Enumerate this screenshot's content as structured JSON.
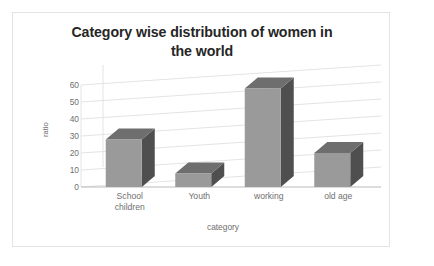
{
  "chart_data": {
    "type": "bar",
    "title": "Category wise distribution of women in the world",
    "title_line1": "Category wise distribution of women in",
    "title_line2": "the world",
    "xlabel": "category",
    "ylabel": "ratio",
    "categories": [
      "School children",
      "Youth",
      "working",
      "old age"
    ],
    "values": [
      28,
      8,
      58,
      20
    ],
    "ylim": [
      0,
      60
    ],
    "yticks": [
      60,
      50,
      40,
      30,
      20,
      10,
      0
    ],
    "ytick_labels": [
      "60",
      "50",
      "40",
      "30",
      "20",
      "10",
      "0"
    ],
    "grid": true,
    "legend": "none",
    "style": "3d-column",
    "colors": {
      "bar_front": "#9a9a9a",
      "bar_side": "#4f4f4f",
      "bar_top": "#6e6e6e",
      "grid": "#e0e0e0",
      "axis_text": "#6f6f6f",
      "title_text": "#262626",
      "frame": "#e3e3e3",
      "background": "#ffffff"
    }
  },
  "category_labels": [
    {
      "line1": "School",
      "line2": "children",
      "text": "School\nchildren"
    },
    {
      "line1": "Youth",
      "line2": "",
      "text": "Youth"
    },
    {
      "line1": "working",
      "line2": "",
      "text": "working"
    },
    {
      "line1": "old age",
      "line2": "",
      "text": "old age"
    }
  ]
}
